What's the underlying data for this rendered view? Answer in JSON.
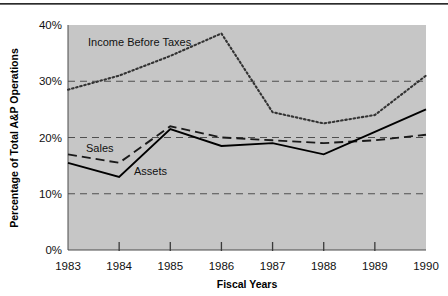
{
  "chart_data": {
    "type": "line",
    "title": "",
    "xlabel": "Fiscal Years",
    "ylabel": "Percentage of Total A&P Operations",
    "categories": [
      "1983",
      "1984",
      "1985",
      "1986",
      "1987",
      "1988",
      "1989",
      "1990"
    ],
    "x": [
      1983,
      1984,
      1985,
      1986,
      1987,
      1988,
      1989,
      1990
    ],
    "ylim": [
      0,
      40
    ],
    "ytick_labels": [
      "0%",
      "10%",
      "20%",
      "30%",
      "40%"
    ],
    "ytick_values": [
      0,
      10,
      20,
      30,
      40
    ],
    "grid": "horizontal-dashed",
    "legend": "inline-annotations",
    "plot_background": "#c6c6c6",
    "series": [
      {
        "name": "Income Before Taxes",
        "style": "dotted",
        "color": "#333333",
        "values": [
          28.5,
          31.0,
          34.5,
          38.5,
          24.5,
          22.5,
          24.0,
          31.0
        ]
      },
      {
        "name": "Sales",
        "style": "dashed",
        "color": "#1a1a1a",
        "values": [
          17.0,
          15.5,
          22.0,
          20.0,
          19.5,
          19.0,
          19.5,
          20.5
        ]
      },
      {
        "name": "Assets",
        "style": "solid",
        "color": "#000000",
        "values": [
          15.5,
          13.0,
          21.5,
          18.5,
          19.0,
          17.0,
          21.0,
          25.0
        ]
      }
    ],
    "annotations": [
      {
        "text": "Income Before Taxes",
        "x_px": 88,
        "y_px": 46
      },
      {
        "text": "Sales",
        "x_px": 86,
        "y_px": 152
      },
      {
        "text": "Assets",
        "x_px": 134,
        "y_px": 175
      }
    ]
  },
  "axes": {
    "x_title": "Fiscal Years",
    "y_title": "Percentage of Total A&P Operations"
  }
}
